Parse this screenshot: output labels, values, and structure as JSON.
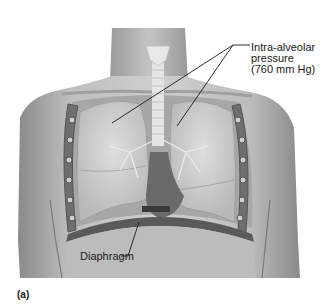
{
  "figure": {
    "panel_label": "(a)",
    "labels": {
      "intra_alveolar": "Intra-alveolar\npressure\n(760 mm Hg)",
      "diaphragm": "Diaphragm"
    }
  }
}
